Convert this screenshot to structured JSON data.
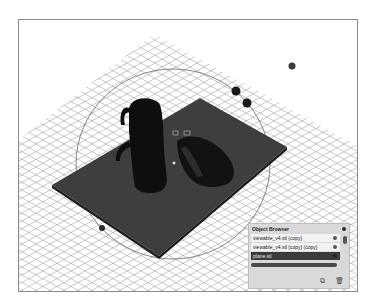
{
  "viewport": {
    "background": "#ffffff",
    "grid_color": "#9a9a9a",
    "plate_color": "#3e3e3e",
    "model_color": "#111111"
  },
  "object_browser": {
    "title": "Object Browser",
    "items": [
      {
        "label": "viewable_v4.stl (copy)",
        "selected": false,
        "icon": "eye-icon"
      },
      {
        "label": "viewable_v4.stl (copy) (copy)",
        "selected": false,
        "icon": "eye-icon",
        "extra": "<"
      },
      {
        "label": "plane.stl",
        "selected": true,
        "icon": "eye-icon"
      }
    ],
    "footer_icons": [
      "duplicate-icon",
      "trash-icon"
    ],
    "footer_glyphs": {
      "duplicate": "⧉",
      "trash": "🗑"
    }
  }
}
